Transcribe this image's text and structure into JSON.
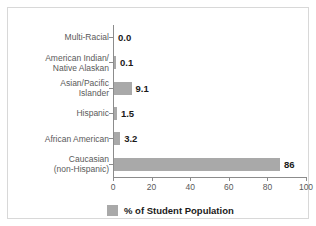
{
  "chart_data": {
    "type": "bar",
    "orientation": "horizontal",
    "title": "",
    "xlabel": "",
    "ylabel": "",
    "xlim": [
      0,
      100
    ],
    "xticks": [
      0,
      20,
      40,
      60,
      80,
      100
    ],
    "xtick_labels": [
      "0",
      "20",
      "40",
      "60",
      "80",
      "100"
    ],
    "grid": false,
    "legend_position": "bottom",
    "series": [
      {
        "name": "% of Student Population",
        "color": "#a9a9a9",
        "values": [
          0.0,
          0.1,
          9.1,
          1.5,
          3.2,
          86
        ]
      }
    ],
    "categories": [
      "Multi-Racial",
      "American Indian/\nNative Alaskan",
      "Asian/Pacific\nIslander",
      "Hispanic",
      "African American",
      "Caucasian\n(non-Hispanic)"
    ],
    "data_labels": [
      "0.0",
      "0.1",
      "9.1",
      "1.5",
      "3.2",
      "86"
    ]
  },
  "legend": {
    "label": "% of Student Population",
    "swatch_color": "#a9a9a9"
  },
  "colors": {
    "bar": "#a9a9a9",
    "axis": "#8c8c8c",
    "text": "#5a5a5a",
    "value_text": "#1a1a1a",
    "frame": "#d8d8d8",
    "background": "#ffffff"
  }
}
